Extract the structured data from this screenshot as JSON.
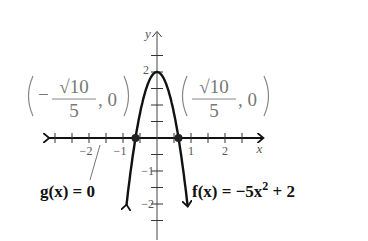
{
  "chart_data": {
    "type": "line",
    "title": "",
    "xlabel": "x",
    "ylabel": "y",
    "xlim": [
      -3.2,
      3.1
    ],
    "ylim": [
      -3.0,
      3.2
    ],
    "x_ticks": [
      -3,
      -2.5,
      -2,
      -1.5,
      -1,
      -0.5,
      0.5,
      1,
      1.5,
      2,
      2.5
    ],
    "x_tick_labels": [
      {
        "value": -2,
        "text": "−2"
      },
      {
        "value": -1,
        "text": "−1"
      },
      {
        "value": 1,
        "text": "1"
      },
      {
        "value": 2,
        "text": "2"
      }
    ],
    "y_ticks": [
      -2.5,
      -2,
      -1.5,
      -1,
      -0.5,
      0.5,
      1,
      1.5,
      2,
      2.5
    ],
    "y_tick_labels": [
      {
        "value": 2,
        "text": "2"
      },
      {
        "value": -1,
        "text": "−1"
      },
      {
        "value": -2,
        "text": "−2"
      }
    ],
    "series": [
      {
        "name": "f(x) = −5x² + 2",
        "function": "-5x^2+2",
        "x_range": [
          -0.9,
          0.9
        ]
      }
    ],
    "points": [
      {
        "x": -0.632,
        "y": 0,
        "label_num": "√10",
        "label_den": "5",
        "label_sign": "−",
        "label_y": "0"
      },
      {
        "x": 0.632,
        "y": 0,
        "label_num": "√10",
        "label_den": "5",
        "label_sign": "",
        "label_y": "0"
      }
    ],
    "annotations": {
      "g_label": "g(x) = 0",
      "f_label_prefix": "f(x) = −5x",
      "f_label_exp": "2",
      "f_label_suffix": " + 2"
    },
    "grid": false
  }
}
